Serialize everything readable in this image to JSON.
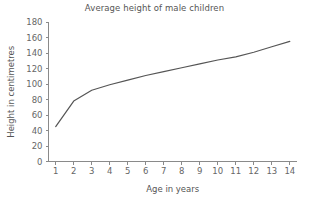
{
  "chart_data": {
    "type": "line",
    "title": "Average height of male children",
    "xlabel": "Age in years",
    "ylabel": "Height in centimetres",
    "x": [
      1,
      2,
      3,
      4,
      5,
      6,
      7,
      8,
      9,
      10,
      11,
      12,
      13,
      14
    ],
    "values": [
      45,
      78,
      92,
      99,
      105,
      111,
      116,
      121,
      126,
      131,
      135,
      141,
      148,
      155
    ],
    "series": [
      {
        "name": "Average height of male children",
        "values": [
          45,
          78,
          92,
          99,
          105,
          111,
          116,
          121,
          126,
          131,
          135,
          141,
          148,
          155
        ]
      }
    ],
    "xlim": [
      0.6,
      14.4
    ],
    "ylim": [
      0,
      180
    ],
    "xticks": [
      1,
      2,
      3,
      4,
      5,
      6,
      7,
      8,
      9,
      10,
      11,
      12,
      13,
      14
    ],
    "xticklabels": [
      "1",
      "2",
      "3",
      "4",
      "5",
      "6",
      "7",
      "8",
      "9",
      "10",
      "11",
      "12",
      "13",
      "14"
    ],
    "yticks": [
      0,
      20,
      40,
      60,
      80,
      100,
      120,
      140,
      160,
      180
    ],
    "yticklabels": [
      "0",
      "20",
      "40",
      "60",
      "80",
      "100",
      "120",
      "140",
      "160",
      "180"
    ],
    "grid": false,
    "legend": false,
    "line_color": "#555555",
    "axis_color": "#8a8a8a",
    "text_color": "#555555",
    "background_color": "#ffffff"
  }
}
